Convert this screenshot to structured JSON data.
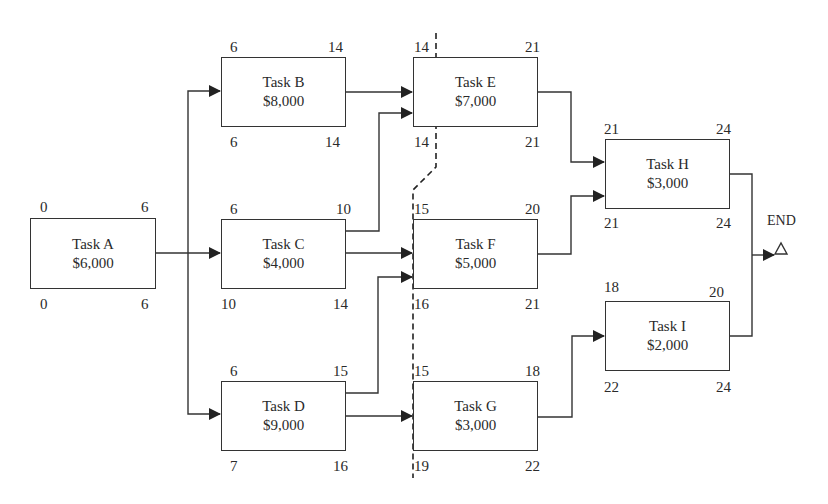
{
  "diagram": {
    "type": "network-diagram",
    "end_label": "END",
    "line_color": "#333333",
    "tasks": [
      {
        "id": "A",
        "name": "Task A",
        "cost": "$6,000",
        "es": "0",
        "ef": "6",
        "ls": "0",
        "lf": "6",
        "box": {
          "x": 30,
          "y": 218,
          "w": 126,
          "h": 71
        }
      },
      {
        "id": "B",
        "name": "Task B",
        "cost": "$8,000",
        "es": "6",
        "ef": "14",
        "ls": "6",
        "lf": "14",
        "box": {
          "x": 221,
          "y": 57,
          "w": 125,
          "h": 70
        }
      },
      {
        "id": "C",
        "name": "Task C",
        "cost": "$4,000",
        "es": "6",
        "ef": "10",
        "ls": "10",
        "lf": "14",
        "box": {
          "x": 221,
          "y": 219,
          "w": 125,
          "h": 70
        }
      },
      {
        "id": "D",
        "name": "Task D",
        "cost": "$9,000",
        "es": "6",
        "ef": "15",
        "ls": "7",
        "lf": "16",
        "box": {
          "x": 221,
          "y": 381,
          "w": 125,
          "h": 70
        }
      },
      {
        "id": "E",
        "name": "Task E",
        "cost": "$7,000",
        "es": "14",
        "ef": "21",
        "ls": "14",
        "lf": "21",
        "box": {
          "x": 413,
          "y": 57,
          "w": 125,
          "h": 70
        }
      },
      {
        "id": "F",
        "name": "Task F",
        "cost": "$5,000",
        "es": "15",
        "ef": "20",
        "ls": "16",
        "lf": "21",
        "box": {
          "x": 413,
          "y": 219,
          "w": 125,
          "h": 70
        }
      },
      {
        "id": "G",
        "name": "Task G",
        "cost": "$3,000",
        "es": "15",
        "ef": "18",
        "ls": "19",
        "lf": "22",
        "box": {
          "x": 413,
          "y": 381,
          "w": 125,
          "h": 70
        }
      },
      {
        "id": "H",
        "name": "Task H",
        "cost": "$3,000",
        "es": "21",
        "ef": "24",
        "ls": "21",
        "lf": "24",
        "box": {
          "x": 605,
          "y": 139,
          "w": 125,
          "h": 70
        }
      },
      {
        "id": "I",
        "name": "Task I",
        "cost": "$2,000",
        "es": "18",
        "ef": "20",
        "ls": "22",
        "lf": "24",
        "box": {
          "x": 605,
          "y": 301,
          "w": 125,
          "h": 70
        }
      }
    ],
    "dependencies": [
      {
        "from": "A",
        "to": "B"
      },
      {
        "from": "A",
        "to": "C"
      },
      {
        "from": "A",
        "to": "D"
      },
      {
        "from": "B",
        "to": "E"
      },
      {
        "from": "C",
        "to": "E"
      },
      {
        "from": "C",
        "to": "F"
      },
      {
        "from": "D",
        "to": "F"
      },
      {
        "from": "D",
        "to": "G"
      },
      {
        "from": "E",
        "to": "H"
      },
      {
        "from": "F",
        "to": "H"
      },
      {
        "from": "G",
        "to": "I"
      },
      {
        "from": "H",
        "to": "END"
      },
      {
        "from": "I",
        "to": "END"
      }
    ],
    "cut_line": {
      "style": "dashed",
      "points": [
        [
          436,
          33
        ],
        [
          436,
          167
        ],
        [
          413,
          190
        ],
        [
          413,
          478
        ]
      ]
    }
  }
}
